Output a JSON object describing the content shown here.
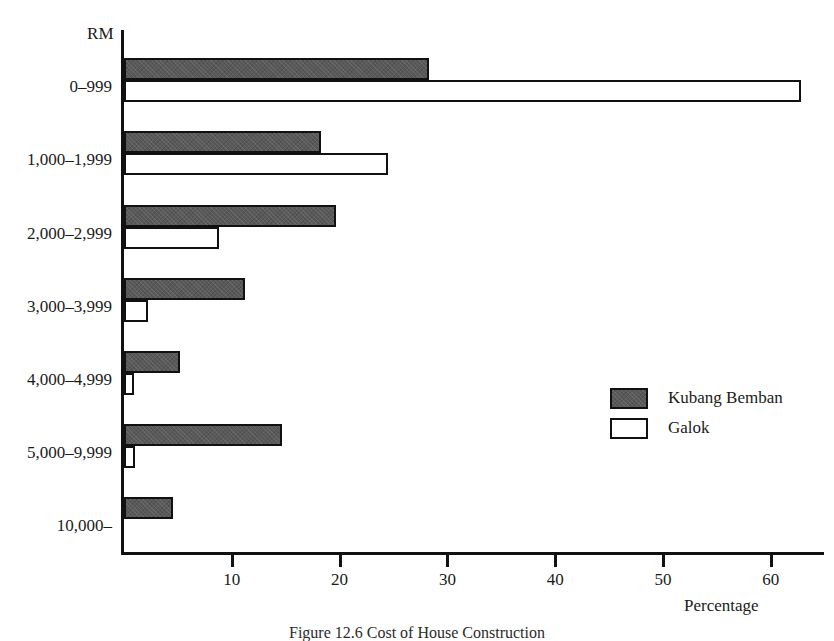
{
  "figure": {
    "axis_header": "RM",
    "caption": "Figure 12.6  Cost of House Construction"
  },
  "legend": {
    "position": "middle-right",
    "items": [
      {
        "label": "Kubang Bemban",
        "swatch": "dark-hatched",
        "color": "#595959"
      },
      {
        "label": "Galok",
        "swatch": "white-outline",
        "color": "#ffffff"
      }
    ]
  },
  "axes": {
    "x_title": "Percentage",
    "x_ticks": [
      "10",
      "20",
      "30",
      "40",
      "50",
      "60"
    ],
    "y_title": "RM"
  },
  "chart_data": {
    "type": "bar",
    "orientation": "horizontal",
    "title": "",
    "xlabel": "Percentage",
    "ylabel": "RM",
    "xlim": [
      0,
      65
    ],
    "grid": false,
    "legend_position": "middle-right",
    "categories": [
      "0–999",
      "1,000–1,999",
      "2,000–2,999",
      "3,000–3,999",
      "4,000–4,999",
      "5,000–9,999",
      "10,000–"
    ],
    "series": [
      {
        "name": "Kubang Bemban",
        "color": "#595959",
        "values": [
          28.3,
          18.3,
          19.7,
          11.2,
          5.2,
          14.7,
          4.5
        ]
      },
      {
        "name": "Galok",
        "color": "#ffffff",
        "values": [
          62.8,
          24.5,
          8.8,
          2.2,
          0.9,
          1.0,
          0.0
        ]
      }
    ]
  }
}
